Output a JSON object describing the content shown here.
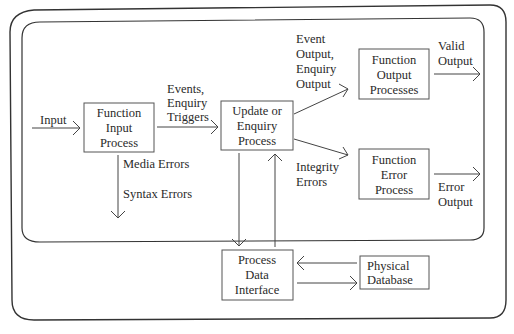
{
  "diagram": {
    "type": "process-flow",
    "frames": [
      {
        "id": "outer",
        "label": ""
      },
      {
        "id": "inner",
        "label": ""
      }
    ],
    "nodes": [
      {
        "id": "function-input-process",
        "lines": [
          "Function",
          "Input",
          "Process"
        ]
      },
      {
        "id": "update-enquiry-process",
        "lines": [
          "Update or",
          "Enquiry",
          "Process"
        ]
      },
      {
        "id": "function-output-processes",
        "lines": [
          "Function",
          "Output",
          "Processes"
        ]
      },
      {
        "id": "function-error-process",
        "lines": [
          "Function",
          "Error",
          "Process"
        ]
      },
      {
        "id": "process-data-interface",
        "lines": [
          "Process",
          "Data",
          "Interface"
        ]
      },
      {
        "id": "physical-database",
        "lines": [
          "Physical",
          "Database"
        ]
      }
    ],
    "edges": [
      {
        "from": "external",
        "to": "function-input-process",
        "label_lines": [
          "Input"
        ]
      },
      {
        "from": "function-input-process",
        "to": "update-enquiry-process",
        "label_lines": [
          "Events,",
          "Enquiry",
          "Triggers"
        ]
      },
      {
        "from": "function-input-process",
        "to": "external",
        "label_lines": [
          "Media Errors",
          "Syntax Errors"
        ]
      },
      {
        "from": "update-enquiry-process",
        "to": "function-output-processes",
        "label_lines": [
          "Event",
          "Output,",
          "Enquiry",
          "Output"
        ]
      },
      {
        "from": "update-enquiry-process",
        "to": "function-error-process",
        "label_lines": [
          "Integrity",
          "Errors"
        ]
      },
      {
        "from": "function-output-processes",
        "to": "external",
        "label_lines": [
          "Valid",
          "Output"
        ]
      },
      {
        "from": "function-error-process",
        "to": "external",
        "label_lines": [
          "Error",
          "Output"
        ]
      },
      {
        "from": "update-enquiry-process",
        "to": "process-data-interface",
        "label_lines": []
      },
      {
        "from": "process-data-interface",
        "to": "update-enquiry-process",
        "label_lines": []
      },
      {
        "from": "physical-database",
        "to": "process-data-interface",
        "label_lines": []
      },
      {
        "from": "process-data-interface",
        "to": "physical-database",
        "label_lines": []
      }
    ]
  }
}
